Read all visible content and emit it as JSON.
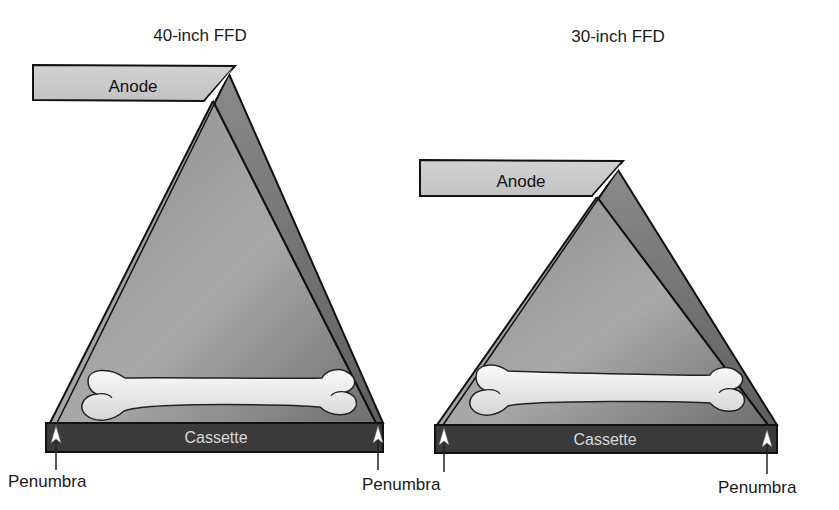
{
  "diagram": {
    "type": "radiography focal-film distance comparison",
    "colors": {
      "anode_fill": "#c9c9c9",
      "beam_back": "#7e7e7e",
      "beam_front_top": "#9a9a9a",
      "beam_front_bottom": "#bdbdbd",
      "cassette_fill": "#3a3a3a",
      "bone_fill": "#ececec",
      "outline": "#111111"
    },
    "panels": [
      {
        "title": "40-inch FFD",
        "anode_label": "Anode",
        "cassette_label": "Cassette",
        "penumbra_left_label": "Penumbra",
        "penumbra_right_label": "Penumbra"
      },
      {
        "title": "30-inch FFD",
        "anode_label": "Anode",
        "cassette_label": "Cassette",
        "penumbra_left_label": "Penumbra",
        "penumbra_right_label": "Penumbra"
      }
    ]
  }
}
